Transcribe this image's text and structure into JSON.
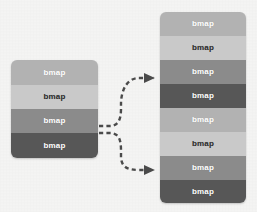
{
  "diagram": {
    "background_color": "#f4f4f3",
    "arrow_color": "#4a4a4a",
    "palette": {
      "light": "#b2b2b2",
      "lighter": "#c9c9c9",
      "medium": "#8b8b8b",
      "dark": "#575757",
      "text_light": "#ffffff",
      "text_dark": "#2a2a2a"
    },
    "source_stack": {
      "name": "source-stack",
      "rows": [
        {
          "label": "bmap",
          "fill": "#b2b2b2",
          "text_color": "#ffffff",
          "height": 25
        },
        {
          "label": "bmap",
          "fill": "#c9c9c9",
          "text_color": "#2a2a2a",
          "height": 24
        },
        {
          "label": "bmap",
          "fill": "#8b8b8b",
          "text_color": "#ffffff",
          "height": 24
        },
        {
          "label": "bmap",
          "fill": "#575757",
          "text_color": "#ffffff",
          "height": 25
        }
      ]
    },
    "target_stack": {
      "name": "target-stack",
      "rows": [
        {
          "label": "bmap",
          "fill": "#b2b2b2",
          "text_color": "#ffffff",
          "height": 24
        },
        {
          "label": "bmap",
          "fill": "#c9c9c9",
          "text_color": "#2a2a2a",
          "height": 24
        },
        {
          "label": "bmap",
          "fill": "#8b8b8b",
          "text_color": "#ffffff",
          "height": 24
        },
        {
          "label": "bmap",
          "fill": "#575757",
          "text_color": "#ffffff",
          "height": 24
        },
        {
          "label": "bmap",
          "fill": "#b2b2b2",
          "text_color": "#ffffff",
          "height": 24
        },
        {
          "label": "bmap",
          "fill": "#c9c9c9",
          "text_color": "#2a2a2a",
          "height": 24
        },
        {
          "label": "bmap",
          "fill": "#8b8b8b",
          "text_color": "#ffffff",
          "height": 24
        },
        {
          "label": "bmap",
          "fill": "#575757",
          "text_color": "#ffffff",
          "height": 23
        }
      ]
    },
    "connectors": [
      {
        "name": "connector-upper",
        "from": "source-stack-row-3",
        "to": "target-stack-row-3",
        "style": "dashed",
        "arrowhead": "triangle",
        "path": "M 99,126 L 110,126 C 122,126 121,112 121,104 C 121,92 126,78 139,78 L 154,78"
      },
      {
        "name": "connector-lower",
        "from": "source-stack-row-3",
        "to": "target-stack-row-7",
        "style": "dashed",
        "arrowhead": "triangle",
        "path": "M 99,133 L 110,133 C 122,133 121,146 121,156 C 121,166 126,170 139,170 L 154,170"
      }
    ]
  }
}
